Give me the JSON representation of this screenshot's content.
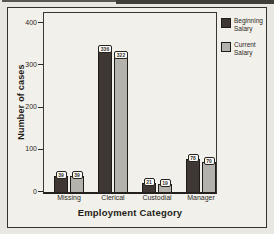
{
  "figure": {
    "kind": "scanned grouped bar chart"
  },
  "chart_data": {
    "type": "bar",
    "title": "",
    "xlabel": "Employment Category",
    "ylabel": "Number of cases",
    "categories": [
      "Missing",
      "Clerical",
      "Custodial",
      "Manager"
    ],
    "series": [
      {
        "name": "Beginning Salary",
        "color": "#3e3734",
        "values": [
          39,
          336,
          21,
          78
        ]
      },
      {
        "name": "Current Salary",
        "color": "#b4b2ad",
        "values": [
          39,
          322,
          19,
          70
        ]
      }
    ],
    "bar_value_labels": [
      [
        "39",
        "336",
        "21",
        "78"
      ],
      [
        "39",
        "322",
        "19",
        "70"
      ]
    ],
    "ylim": [
      0,
      400
    ],
    "yticks": [
      400,
      300,
      200,
      100,
      0
    ],
    "grid": false,
    "legend_position": "right",
    "legend_labels": [
      "Beginning\nSalary",
      "Current\nSalary"
    ]
  }
}
